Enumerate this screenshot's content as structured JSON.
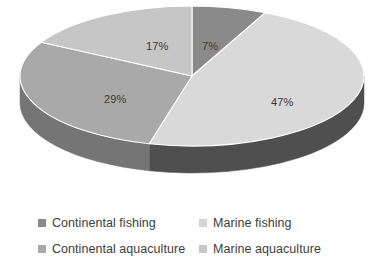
{
  "chart_data": {
    "type": "pie",
    "title": "",
    "subtitle": "",
    "xlabel": "",
    "ylabel": "",
    "grid": false,
    "three_d": true,
    "legend_position": "bottom",
    "legend_columns": 2,
    "value_unit": "percent",
    "categories": [
      "Continental fishing",
      "Marine fishing",
      "Continental aquaculture",
      "Marine aquaculture"
    ],
    "values": [
      7,
      47,
      29,
      17
    ],
    "labels": [
      "7%",
      "47%",
      "29%",
      "17%"
    ],
    "slices": [
      {
        "name": "Continental fishing",
        "value": 7,
        "label": "7%",
        "color": "#8a8a8a",
        "side_color": "#6e6e6e",
        "start_angle": 0,
        "end_angle": 25.2,
        "label_x": 202,
        "label_y": 40
      },
      {
        "name": "Marine fishing",
        "value": 47,
        "label": "47%",
        "color": "#d9d9d9",
        "side_color": "#4f4f4f",
        "start_angle": 25.2,
        "end_angle": 194.4,
        "label_x": 271,
        "label_y": 96
      },
      {
        "name": "Continental aquaculture",
        "value": 29,
        "label": "29%",
        "color": "#a9a9a9",
        "side_color": "#757575",
        "start_angle": 194.4,
        "end_angle": 298.8,
        "label_x": 104,
        "label_y": 93
      },
      {
        "name": "Marine aquaculture",
        "value": 17,
        "label": "17%",
        "color": "#c6c6c6",
        "side_color": "#8f8f8f",
        "start_angle": 298.8,
        "end_angle": 360,
        "label_x": 146,
        "label_y": 40
      }
    ],
    "geometry": {
      "center_x": 192,
      "center_y": 76,
      "radius_x": 172,
      "radius_y": 70,
      "depth": 27
    }
  },
  "legend": {
    "items": [
      {
        "label": "Continental fishing",
        "color": "#8a8a8a",
        "row": 0,
        "col": 0
      },
      {
        "label": "Marine fishing",
        "color": "#d4d4d4",
        "row": 0,
        "col": 1
      },
      {
        "label": "Continental aquaculture",
        "color": "#a9a9a9",
        "row": 1,
        "col": 0
      },
      {
        "label": "Marine aquaculture",
        "color": "#c6c6c6",
        "row": 1,
        "col": 1
      }
    ]
  },
  "colors": {
    "background": "#ffffff",
    "label_text": "#3a3a3a",
    "legend_text": "#3d3d3d"
  }
}
